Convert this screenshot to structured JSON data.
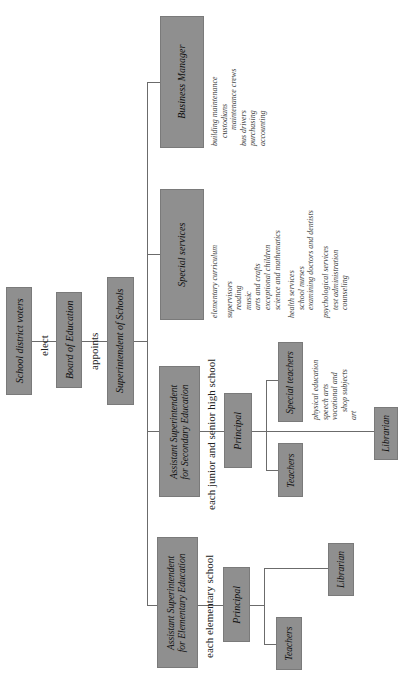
{
  "orientation": "rotated 90 degrees counterclockwise",
  "colors": {
    "box_fill": "#8f8f8f",
    "line": "#6b6b6b",
    "text": "#222222",
    "background": "#ffffff"
  },
  "nodes": {
    "voters": "School district voters",
    "board": "Board of Education",
    "superintendent": "Superintendent of Schools",
    "business_manager": "Business Manager",
    "special_services": "Special services",
    "asst_secondary_line1": "Assistant Superintendent",
    "asst_secondary_line2": "for Secondary Education",
    "asst_elementary_line1": "Assistant Superintendent",
    "asst_elementary_line2": "for Elementary Education",
    "secondary_principal": "Principal",
    "secondary_teachers": "Teachers",
    "secondary_special_teachers": "Special teachers",
    "secondary_librarian": "Librarian",
    "elementary_principal": "Principal",
    "elementary_teachers": "Teachers",
    "elementary_librarian": "Librarian"
  },
  "edge_labels": {
    "elect": "elect",
    "appoints": "appoints",
    "secondary_scope": "each junior and senior high school",
    "elementary_scope": "each elementary school"
  },
  "business_manager_duties": [
    "building maintenance",
    "custodians",
    "maintenance crews",
    "bus drivers",
    "purchasing",
    "accounting"
  ],
  "special_services_duties": {
    "curriculum": "elementary curriculum",
    "supervisors": "supervisors",
    "supervisor_areas": [
      "reading",
      "music",
      "arts and crafts",
      "exceptional children",
      "science and mathematics"
    ],
    "health": "health services",
    "health_items": [
      "school nurses",
      "examining doctors and dentists"
    ],
    "psych": "psychological services",
    "psych_items": [
      "test administration",
      "counseling"
    ]
  },
  "special_teacher_subjects": [
    "physical education",
    "speech arts",
    "vocational and",
    "shop subjects",
    "art"
  ]
}
